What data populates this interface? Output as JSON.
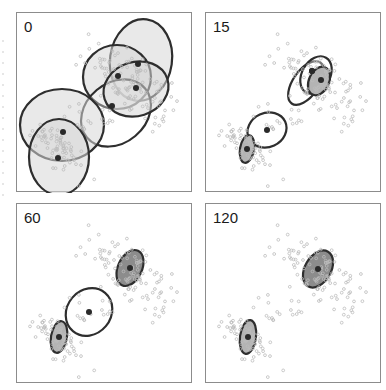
{
  "figure": {
    "title": ""
  },
  "colors": {
    "point": "#bcbcbc",
    "ellipse_stroke": "#2e2e2e",
    "fill_light": "#e4e4e4",
    "fill_medium": "#b4b4b4",
    "fill_dark": "#8c8c8c",
    "mean": "#2a2a2a",
    "panel_border": "#8c8c8c"
  },
  "chart_data": {
    "type": "scatter",
    "title": "",
    "xlabel": "",
    "ylabel": "",
    "grid": false,
    "legend": "none",
    "layout": "2x2 small multiples",
    "point_clusters": [
      {
        "name": "cluster-lower-left",
        "cx": 42,
        "cy": 136,
        "sx": 8,
        "sy": 16,
        "rho": 0.35,
        "n": 70,
        "seed": 11
      },
      {
        "name": "cluster-upper-right",
        "cx": 112,
        "cy": 68,
        "sx": 15,
        "sy": 22,
        "rho": 0.55,
        "n": 110,
        "seed": 23
      },
      {
        "name": "bridge-points",
        "cx": 76,
        "cy": 104,
        "sx": 12,
        "sy": 12,
        "rho": 0.7,
        "n": 18,
        "seed": 37
      }
    ],
    "panels": [
      {
        "label": "0",
        "iteration": 0,
        "components": [
          {
            "cx": 124,
            "cy": 47,
            "rx": 31,
            "ry": 41,
            "angle": 8,
            "fill": "light",
            "mx": 121,
            "my": 51
          },
          {
            "cx": 100,
            "cy": 64,
            "rx": 34,
            "ry": 32,
            "angle": 0,
            "fill": "light",
            "mx": 101,
            "my": 63
          },
          {
            "cx": 99,
            "cy": 100,
            "rx": 38,
            "ry": 30,
            "angle": -40,
            "fill": "white",
            "mx": 95,
            "my": 93
          },
          {
            "cx": 119,
            "cy": 76,
            "rx": 33,
            "ry": 27,
            "angle": -18,
            "fill": "light",
            "mx": 119,
            "my": 75
          },
          {
            "cx": 45,
            "cy": 112,
            "rx": 42,
            "ry": 36,
            "angle": 0,
            "fill": "light",
            "mx": 46,
            "my": 119
          },
          {
            "cx": 42,
            "cy": 144,
            "rx": 30,
            "ry": 38,
            "angle": 0,
            "fill": "light",
            "mx": 41,
            "my": 145
          }
        ]
      },
      {
        "label": "15",
        "iteration": 15,
        "components": [
          {
            "cx": 61,
            "cy": 117,
            "rx": 20,
            "ry": 17,
            "angle": -25,
            "fill": "white",
            "mx": 61,
            "my": 117
          },
          {
            "cx": 100,
            "cy": 70,
            "rx": 13,
            "ry": 25,
            "angle": 35,
            "fill": "white",
            "mx": 106,
            "my": 58
          },
          {
            "cx": 110,
            "cy": 62,
            "rx": 14,
            "ry": 20,
            "angle": 30,
            "fill": "white",
            "mx": 106,
            "my": 58
          },
          {
            "cx": 113,
            "cy": 68,
            "rx": 10,
            "ry": 15,
            "angle": 25,
            "fill": "medium",
            "mx": 115,
            "my": 67
          },
          {
            "cx": 41,
            "cy": 136,
            "rx": 7,
            "ry": 14,
            "angle": 10,
            "fill": "medium",
            "mx": 41,
            "my": 136
          }
        ]
      },
      {
        "label": "60",
        "iteration": 60,
        "components": [
          {
            "cx": 72,
            "cy": 108,
            "rx": 22,
            "ry": 25,
            "angle": 40,
            "fill": "white",
            "mx": 72,
            "my": 108
          },
          {
            "cx": 113,
            "cy": 64,
            "rx": 12,
            "ry": 19,
            "angle": 25,
            "fill": "dark",
            "mx": 113,
            "my": 64
          },
          {
            "cx": 42,
            "cy": 133,
            "rx": 8,
            "ry": 16,
            "angle": 10,
            "fill": "medium",
            "mx": 42,
            "my": 133
          }
        ]
      },
      {
        "label": "120",
        "iteration": 120,
        "components": [
          {
            "cx": 112,
            "cy": 65,
            "rx": 13,
            "ry": 20,
            "angle": 30,
            "fill": "dark",
            "mx": 112,
            "my": 65
          },
          {
            "cx": 42,
            "cy": 133,
            "rx": 8,
            "ry": 17,
            "angle": 8,
            "fill": "medium",
            "mx": 42,
            "my": 133
          }
        ]
      }
    ]
  },
  "panels": [
    {
      "label": "0"
    },
    {
      "label": "15"
    },
    {
      "label": "60"
    },
    {
      "label": "120"
    }
  ]
}
